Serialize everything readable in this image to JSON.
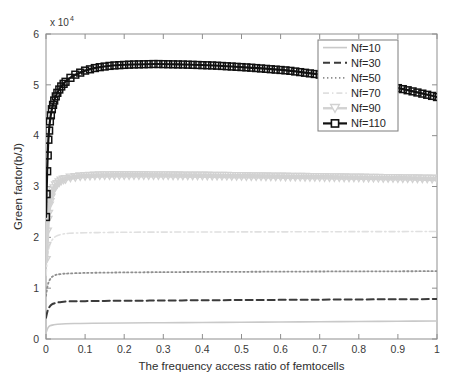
{
  "chart_data": {
    "type": "line",
    "title": "",
    "xlabel": "The frequency access ratio of femtocells",
    "ylabel": "Green factor(b/J)",
    "y_exponent_label": "x 10",
    "y_exponent_power": "4",
    "xlim": [
      0,
      1
    ],
    "ylim": [
      0,
      6
    ],
    "xticks": [
      "0",
      "0.1",
      "0.2",
      "0.3",
      "0.4",
      "0.5",
      "0.6",
      "0.7",
      "0.8",
      "0.9",
      "1"
    ],
    "xtick_values": [
      0,
      0.1,
      0.2,
      0.3,
      0.4,
      0.5,
      0.6,
      0.7,
      0.8,
      0.9,
      1
    ],
    "yticks": [
      "0",
      "1",
      "2",
      "3",
      "4",
      "5",
      "6"
    ],
    "ytick_values": [
      0,
      1,
      2,
      3,
      4,
      5,
      6
    ],
    "grid": false,
    "legend_position": "upper right",
    "legend_entries": [
      "Nf=10",
      "Nf=30",
      "Nf=50",
      "Nf=70",
      "Nf=90",
      "Nf=110"
    ],
    "series": [
      {
        "name": "Nf=10",
        "color": "#c9c9c9",
        "style": "solid",
        "marker": "none",
        "width": 1.6,
        "x": [
          0,
          0.005,
          0.01,
          0.02,
          0.03,
          0.05,
          0.08,
          0.12,
          0.2,
          0.3,
          0.4,
          0.5,
          0.6,
          0.7,
          0.8,
          0.9,
          1.0
        ],
        "values": [
          0.12,
          0.22,
          0.26,
          0.28,
          0.29,
          0.3,
          0.305,
          0.31,
          0.315,
          0.32,
          0.325,
          0.33,
          0.335,
          0.34,
          0.345,
          0.35,
          0.355
        ]
      },
      {
        "name": "Nf=30",
        "color": "#3b3b3b",
        "style": "dashed",
        "marker": "none",
        "width": 2.0,
        "x": [
          0,
          0.004,
          0.008,
          0.015,
          0.025,
          0.04,
          0.06,
          0.1,
          0.15,
          0.2,
          0.3,
          0.4,
          0.5,
          0.6,
          0.7,
          0.8,
          0.9,
          1.0
        ],
        "values": [
          0.42,
          0.55,
          0.62,
          0.68,
          0.71,
          0.73,
          0.74,
          0.745,
          0.75,
          0.752,
          0.757,
          0.762,
          0.766,
          0.77,
          0.774,
          0.778,
          0.782,
          0.786
        ]
      },
      {
        "name": "Nf=50",
        "color": "#8f8f8f",
        "style": "dotted",
        "marker": "none",
        "width": 1.8,
        "x": [
          0,
          0.004,
          0.008,
          0.015,
          0.025,
          0.04,
          0.06,
          0.1,
          0.15,
          0.2,
          0.3,
          0.4,
          0.5,
          0.6,
          0.7,
          0.8,
          0.9,
          1.0
        ],
        "values": [
          0.85,
          1.04,
          1.14,
          1.22,
          1.26,
          1.28,
          1.29,
          1.3,
          1.305,
          1.31,
          1.315,
          1.32,
          1.322,
          1.325,
          1.328,
          1.33,
          1.332,
          1.335
        ]
      },
      {
        "name": "Nf=70",
        "color": "#e0e0e0",
        "style": "dashdot",
        "marker": "none",
        "width": 1.6,
        "x": [
          0,
          0.004,
          0.008,
          0.015,
          0.025,
          0.04,
          0.06,
          0.1,
          0.15,
          0.2,
          0.3,
          0.4,
          0.5,
          0.6,
          0.7,
          0.8,
          0.9,
          1.0
        ],
        "values": [
          1.25,
          1.62,
          1.8,
          1.94,
          2.02,
          2.06,
          2.08,
          2.09,
          2.095,
          2.1,
          2.103,
          2.105,
          2.107,
          2.108,
          2.11,
          2.112,
          2.113,
          2.115
        ]
      },
      {
        "name": "Nf=90",
        "color": "#d2d2d2",
        "style": "solid",
        "marker": "triangle-down",
        "width": 4.5,
        "x": [
          0,
          0.004,
          0.008,
          0.015,
          0.025,
          0.04,
          0.06,
          0.09,
          0.13,
          0.18,
          0.25,
          0.33,
          0.42,
          0.52,
          0.62,
          0.72,
          0.82,
          0.91,
          1.0
        ],
        "values": [
          1.55,
          2.3,
          2.62,
          2.87,
          3.02,
          3.12,
          3.17,
          3.2,
          3.215,
          3.22,
          3.22,
          3.215,
          3.21,
          3.2,
          3.19,
          3.18,
          3.17,
          3.16,
          3.15
        ]
      },
      {
        "name": "Nf=110",
        "color": "#111111",
        "style": "solid",
        "marker": "square",
        "width": 2.2,
        "x": [
          0,
          0.003,
          0.006,
          0.01,
          0.015,
          0.022,
          0.03,
          0.04,
          0.055,
          0.075,
          0.1,
          0.13,
          0.17,
          0.22,
          0.28,
          0.35,
          0.43,
          0.52,
          0.62,
          0.72,
          0.82,
          0.91,
          1.0
        ],
        "values": [
          2.4,
          3.3,
          3.92,
          4.28,
          4.52,
          4.72,
          4.86,
          4.98,
          5.1,
          5.2,
          5.28,
          5.34,
          5.38,
          5.4,
          5.41,
          5.4,
          5.38,
          5.34,
          5.28,
          5.18,
          5.06,
          4.92,
          4.76
        ]
      }
    ]
  }
}
